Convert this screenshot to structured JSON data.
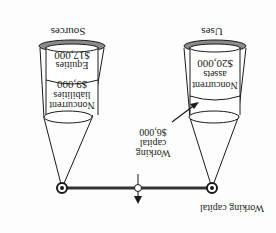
{
  "orientation": "rotated-180",
  "beam_label": "Working capital",
  "left_column": {
    "title": "Sources",
    "segments": [
      {
        "label_line1": "Equities",
        "value": "$17,000"
      },
      {
        "label_line1": "Noncurrent",
        "label_line2": "liabilities",
        "value": "$9,000"
      }
    ]
  },
  "right_column": {
    "title": "Uses",
    "segments": [
      {
        "label_line1": "Noncurrent",
        "label_line2": "assets",
        "value": "$20,000"
      }
    ]
  },
  "callout": {
    "line1": "Working",
    "line2": "capital",
    "value": "$6,000"
  },
  "colors": {
    "stroke": "#1a1a1a",
    "rim_fill": "#8a8a8a",
    "beam": "#333333"
  }
}
